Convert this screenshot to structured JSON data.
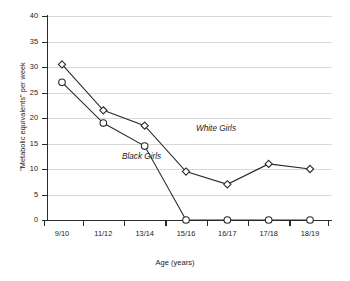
{
  "chart_data": {
    "type": "line",
    "title": "",
    "xlabel": "Age (years)",
    "ylabel": "\"Metabolic equivalents\" per week",
    "categories": [
      "9/10",
      "11/12",
      "13/14",
      "15/16",
      "16/17",
      "17/18",
      "18/19"
    ],
    "ylim": [
      0,
      40
    ],
    "yticks": [
      0,
      5,
      10,
      15,
      20,
      25,
      30,
      35,
      40
    ],
    "grid": true,
    "legend_position": "inline-annotations",
    "series": [
      {
        "name": "White Girls",
        "marker": "diamond",
        "values": [
          30.5,
          21.5,
          18.5,
          9.5,
          7.0,
          11.0,
          10.0
        ]
      },
      {
        "name": "Black Girls",
        "marker": "circle",
        "values": [
          27.0,
          19.0,
          14.5,
          0.0,
          0.0,
          0.0,
          0.0
        ]
      }
    ],
    "annotations": [
      {
        "text": "White Girls",
        "series": "White Girls"
      },
      {
        "text": "Black Girls",
        "series": "Black Girls"
      }
    ]
  }
}
